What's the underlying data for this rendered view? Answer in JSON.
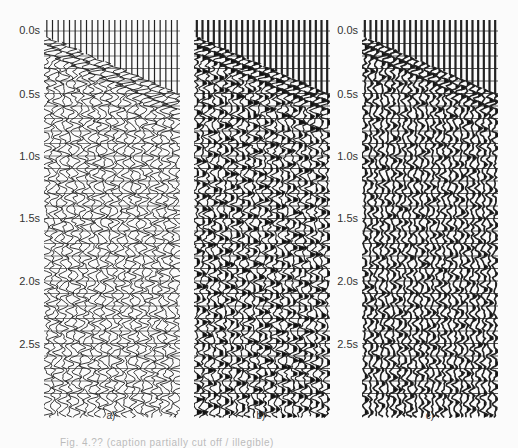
{
  "figure": {
    "panels": [
      {
        "id": "a",
        "label": "a)",
        "style": "wiggle",
        "x": 44
      },
      {
        "id": "b",
        "label": "b)",
        "style": "variable-area-coarse",
        "x": 194
      },
      {
        "id": "c",
        "label": "c)",
        "style": "variable-area-dense",
        "x": 362
      }
    ],
    "time_axis": {
      "unit": "s",
      "ticks": [
        "0.0s",
        "0.5s",
        "1.0s",
        "1.5s",
        "2.0s",
        "2.5s"
      ],
      "tick_values": [
        0.0,
        0.5,
        1.0,
        1.5,
        2.0,
        2.5
      ],
      "shown_on_panels": [
        "a",
        "c"
      ]
    },
    "trace_count": 24,
    "caption_fragment": "Fig. 4.?? (caption partially cut off / illegible)"
  },
  "chart_data": {
    "type": "seismic-section",
    "title": "",
    "panels": [
      "a)",
      "b)",
      "c)"
    ],
    "ylabel": "time (s)",
    "yticks": [
      "0.0s",
      "0.5s",
      "1.0s",
      "1.5s",
      "2.0s",
      "2.5s"
    ],
    "ylim": [
      0.0,
      2.95
    ],
    "traces_per_panel": 24,
    "first_break_time_s": {
      "near_offset": 0.05,
      "far_offset": 0.5
    },
    "notes": [
      "a) wiggle display",
      "b) variable-area display with ground-roll pattern",
      "c) dense variable-area display"
    ]
  }
}
